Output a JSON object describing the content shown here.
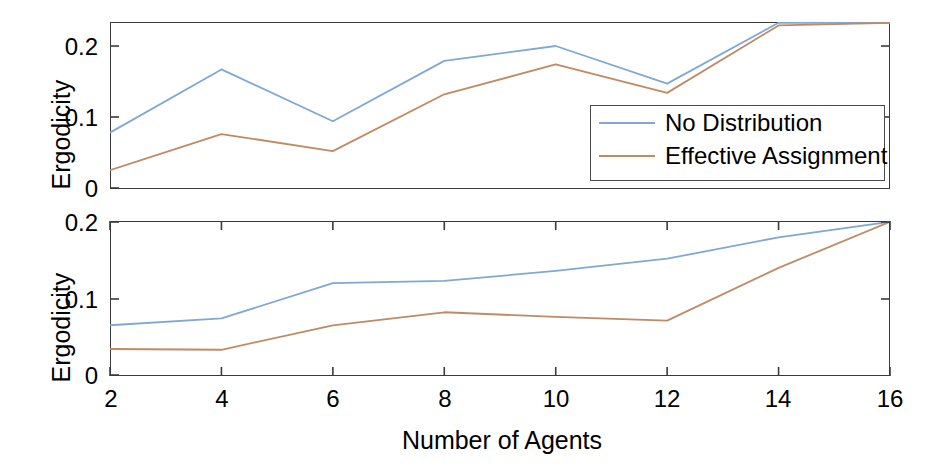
{
  "figure": {
    "background_color": "#ffffff",
    "series_colors": {
      "no_distribution": "#7fa8d6",
      "effective_assignment": "#c08a63"
    },
    "axis_color": "#3a3a3a"
  },
  "legend": {
    "position": "inside-top-plot-right",
    "entries": [
      {
        "label": "No Distribution",
        "color": "#7fa8d6"
      },
      {
        "label": "Effective Assignment",
        "color": "#c08a63"
      }
    ]
  },
  "xlabel": "Number of Agents",
  "xticks": [
    "2",
    "4",
    "6",
    "8",
    "10",
    "12",
    "14",
    "16"
  ],
  "top_plot": {
    "ylabel": "Ergodicity",
    "yticks": [
      "0",
      "0.1",
      "0.2"
    ]
  },
  "bottom_plot": {
    "ylabel": "Ergodicity",
    "yticks": [
      "0",
      "0.1",
      "0.2"
    ]
  },
  "chart_data": [
    {
      "type": "line",
      "id": "top-plot",
      "title": "",
      "xlabel": "",
      "ylabel": "Ergodicity",
      "x": [
        2,
        4,
        6,
        8,
        10,
        12,
        14,
        16
      ],
      "xlim": [
        2,
        16
      ],
      "ylim": [
        0,
        0.234
      ],
      "xticks": [
        2,
        4,
        6,
        8,
        10,
        12,
        14,
        16
      ],
      "yticks": [
        0,
        0.1,
        0.2
      ],
      "grid": false,
      "legend_position": "inside right",
      "series": [
        {
          "name": "No Distribution",
          "color": "#7fa8d6",
          "values": [
            0.078,
            0.167,
            0.094,
            0.179,
            0.2,
            0.147,
            0.239,
            0.24
          ]
        },
        {
          "name": "Effective Assignment",
          "color": "#c08a63",
          "values": [
            0.025,
            0.076,
            0.052,
            0.132,
            0.174,
            0.134,
            0.229,
            0.235
          ]
        }
      ]
    },
    {
      "type": "line",
      "id": "bottom-plot",
      "title": "",
      "xlabel": "Number of Agents",
      "ylabel": "Ergodicity",
      "x": [
        2,
        4,
        6,
        8,
        10,
        12,
        14,
        16
      ],
      "xlim": [
        2,
        16
      ],
      "ylim": [
        0,
        0.21
      ],
      "xticks": [
        2,
        4,
        6,
        8,
        10,
        12,
        14,
        16
      ],
      "yticks": [
        0,
        0.1,
        0.2
      ],
      "grid": false,
      "legend_position": "none",
      "series": [
        {
          "name": "No Distribution",
          "color": "#7fa8d6",
          "values": [
            0.065,
            0.074,
            0.12,
            0.123,
            0.136,
            0.152,
            0.18,
            0.21
          ]
        },
        {
          "name": "Effective Assignment",
          "color": "#c08a63",
          "values": [
            0.034,
            0.033,
            0.065,
            0.082,
            0.076,
            0.071,
            0.14,
            0.21
          ]
        }
      ]
    }
  ]
}
